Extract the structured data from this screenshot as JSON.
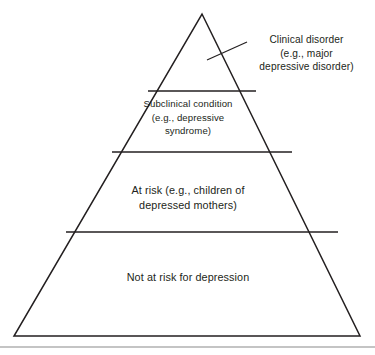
{
  "figure": {
    "background_color": "#ffffff",
    "stroke_color": "#231f20",
    "text_color": "#231f20"
  },
  "pyramid": {
    "apex": {
      "x": 202,
      "y": 14
    },
    "base_left": {
      "x": 14,
      "y": 336
    },
    "base_right": {
      "x": 360,
      "y": 336
    },
    "bands": [
      {
        "id": "clinical-disorder",
        "level": 1,
        "position": "apex",
        "label": "Clinical disorder\n(e.g., major\ndepressive disorder)",
        "label_placement": "external-callout",
        "top_y": 14,
        "bottom_y": 91
      },
      {
        "id": "subclinical-condition",
        "level": 2,
        "position": "upper-middle",
        "label": "Subclinical condition\n(e.g., depressive\nsyndrome)",
        "label_placement": "inside",
        "top_y": 91,
        "bottom_y": 152
      },
      {
        "id": "at-risk",
        "level": 3,
        "position": "lower-middle",
        "label": "At risk (e.g., children of\ndepressed mothers)",
        "label_placement": "inside",
        "top_y": 152,
        "bottom_y": 232
      },
      {
        "id": "not-at-risk",
        "level": 4,
        "position": "base",
        "label": "Not at risk for depression",
        "label_placement": "inside",
        "top_y": 232,
        "bottom_y": 336
      }
    ],
    "dividers": [
      {
        "y": 91,
        "x1": 148,
        "x2": 256
      },
      {
        "y": 152,
        "x1": 112,
        "x2": 292
      },
      {
        "y": 232,
        "x1": 66,
        "x2": 338
      }
    ],
    "callout_leader_line": {
      "x1": 207,
      "y1": 60,
      "x2": 247,
      "y2": 42
    }
  },
  "footer_rule": {
    "y": 347,
    "x1": 0,
    "x2": 375,
    "color": "#8a8a8a"
  }
}
